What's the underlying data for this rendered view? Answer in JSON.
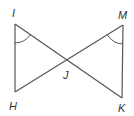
{
  "diagram": {
    "type": "geometry",
    "points": {
      "I": {
        "label": "I",
        "x": 15,
        "y": 24
      },
      "M": {
        "label": "M",
        "x": 123,
        "y": 25
      },
      "H": {
        "label": "H",
        "x": 15,
        "y": 92
      },
      "K": {
        "label": "K",
        "x": 122,
        "y": 98
      },
      "J": {
        "label": "J",
        "x": 67,
        "y": 61
      }
    },
    "segments": [
      "IH",
      "IK",
      "MK",
      "MH"
    ],
    "angle_marks": [
      "angle HIJ",
      "angle KMJ"
    ],
    "colors": {
      "line": "#555555",
      "text": "#333333"
    }
  }
}
